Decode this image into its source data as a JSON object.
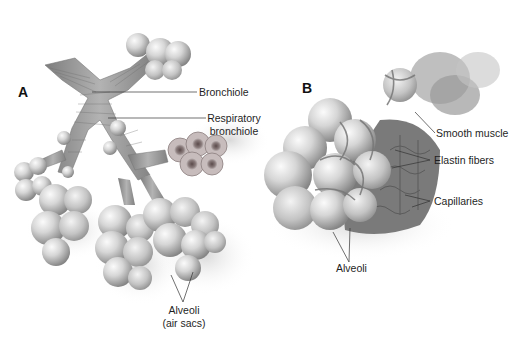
{
  "figure": {
    "panel_a": {
      "letter": "A",
      "labels": {
        "bronchiole": "Bronchiole",
        "respiratory_bronchiole_line1": "Respiratory",
        "respiratory_bronchiole_line2": "bronchiole",
        "alveoli_line1": "Alveoli",
        "alveoli_line2": "(air sacs)"
      }
    },
    "panel_b": {
      "letter": "B",
      "labels": {
        "smooth_muscle": "Smooth muscle",
        "elastin_fibers": "Elastin fibers",
        "capillaries": "Capillaries",
        "alveoli": "Alveoli"
      }
    },
    "colors": {
      "background": "#ffffff",
      "sphere_light": "#f2f2f2",
      "sphere_mid": "#bdbdbd",
      "sphere_dark": "#8a8a8a",
      "tube": "#9a9a9a",
      "network": "#6d6d6d",
      "leader": "#333333"
    }
  }
}
